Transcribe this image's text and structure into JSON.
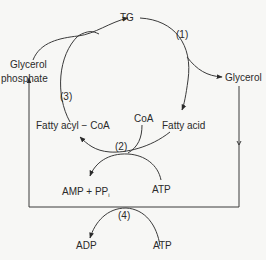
{
  "diagram": {
    "type": "metabolic-cycle",
    "nodes": {
      "tg": "TG",
      "glycerol": "Glycerol",
      "glycerol_phosphate_line1": "Glycerol",
      "glycerol_phosphate_line2": "phosphate",
      "fatty_acyl_coa": "Fatty acyl − CoA",
      "coa": "CoA",
      "fatty_acid": "Fatty acid",
      "amp_ppi": "AMP + PP",
      "amp_ppi_subscript": "i",
      "atp_top": "ATP",
      "adp": "ADP",
      "atp_bottom": "ATP"
    },
    "steps": {
      "step1": "(1)",
      "step2": "(2)",
      "step3": "(3)",
      "step4": "(4)"
    },
    "edges": [
      {
        "from": "TG",
        "to": "Fatty acid",
        "via": "(1)"
      },
      {
        "from": "TG",
        "to": "Glycerol",
        "via": "(1)"
      },
      {
        "from": "Fatty acid",
        "to": "Fatty acyl − CoA",
        "via": "(2)",
        "cofactors_in": [
          "CoA",
          "ATP"
        ],
        "cofactors_out": [
          "AMP + PPi"
        ]
      },
      {
        "from": "Fatty acyl − CoA",
        "to": "TG",
        "via": "(3)"
      },
      {
        "from": "Glycerol phosphate",
        "to": "TG",
        "via": "(3)"
      },
      {
        "from": "Glycerol",
        "to": "Glycerol phosphate",
        "via": "(4)",
        "cofactors_in": [
          "ATP"
        ],
        "cofactors_out": [
          "ADP"
        ]
      }
    ]
  }
}
